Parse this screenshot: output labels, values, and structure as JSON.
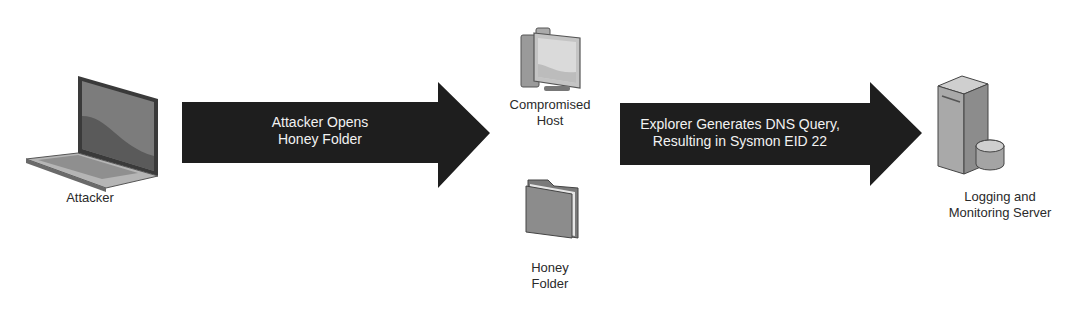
{
  "nodes": {
    "attacker": {
      "label": "Attacker",
      "icon": "laptop-icon"
    },
    "compromised_host": {
      "label_line1": "Compromised",
      "label_line2": "Host",
      "icon": "desktop-computer-icon"
    },
    "honey_folder": {
      "label_line1": "Honey",
      "label_line2": "Folder",
      "icon": "folder-icon"
    },
    "logging_server": {
      "label_line1": "Logging and",
      "label_line2": "Monitoring Server",
      "icon": "server-database-icon"
    }
  },
  "edges": [
    {
      "from": "attacker",
      "to": "compromised_host",
      "line1": "Attacker Opens",
      "line2": "Honey Folder"
    },
    {
      "from": "compromised_host",
      "to": "logging_server",
      "line1": "Explorer Generates DNS Query,",
      "line2": "Resulting in Sysmon EID 22"
    }
  ],
  "colors": {
    "arrow": "#1e1e1e",
    "arrow_text": "#f2f2f2",
    "icon_gray": "#8a8a8a",
    "background": "#ffffff"
  }
}
